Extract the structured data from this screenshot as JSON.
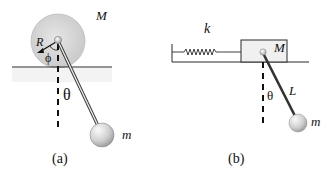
{
  "figure": {
    "panels": [
      {
        "id": "a",
        "caption": "(a)",
        "labels": {
          "disk_mass": "M",
          "radius": "R",
          "angle_phi": "ϕ",
          "angle_theta": "θ",
          "bob_mass": "m"
        },
        "description": "Pendulum of mass m hanging from the rim-pivot of a disk of mass M and radius R rolling on a horizontal surface"
      },
      {
        "id": "b",
        "caption": "(b)",
        "labels": {
          "spring_constant": "k",
          "block_mass": "M",
          "length": "L",
          "angle_theta": "θ",
          "bob_mass": "m"
        },
        "description": "Pendulum of length L and mass m hanging from a block of mass M attached to a wall by spring k on a horizontal surface"
      }
    ]
  },
  "colors": {
    "line": "#2a2a2a",
    "disk_fill": "#d6d6d6",
    "disk_edge": "#bcbcbc",
    "ball_light": "#f4f4f4",
    "ball_dark": "#a8a8a8",
    "block_fill": "#efefef"
  }
}
